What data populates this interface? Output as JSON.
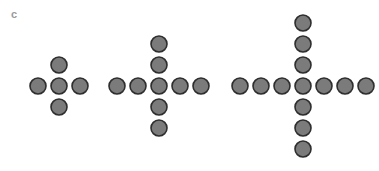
{
  "panel_label": "c",
  "style": {
    "fill": "#7b7b7b",
    "stroke": "#2e2e2e",
    "radius": 8,
    "spacing": 21
  },
  "figures": [
    {
      "name": "cross-1",
      "cx": 59,
      "cy": 86,
      "arm_up": 1,
      "arm_down": 1,
      "arm_left": 1,
      "arm_right": 1
    },
    {
      "name": "cross-2",
      "cx": 159,
      "cy": 86,
      "arm_up": 2,
      "arm_down": 2,
      "arm_left": 2,
      "arm_right": 2
    },
    {
      "name": "cross-3",
      "cx": 303,
      "cy": 86,
      "arm_up": 3,
      "arm_down": 3,
      "arm_left": 3,
      "arm_right": 3
    }
  ]
}
